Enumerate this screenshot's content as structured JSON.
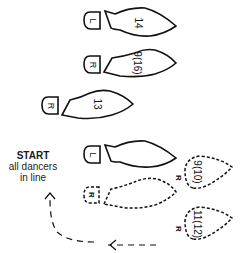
{
  "diagram": {
    "type": "dance-step-footprints",
    "start": {
      "title": "START",
      "line1": "all dancers",
      "line2": "in line"
    },
    "footprints": [
      {
        "id": "fp1",
        "foot": "L",
        "step": "14",
        "style": "solid",
        "size": "full"
      },
      {
        "id": "fp2",
        "foot": "R",
        "step": "9(16)",
        "style": "solid",
        "size": "full"
      },
      {
        "id": "fp3",
        "foot": "R",
        "step": "13",
        "style": "solid",
        "size": "full"
      },
      {
        "id": "fp4",
        "foot": "L",
        "step": "",
        "style": "solid",
        "size": "full"
      },
      {
        "id": "fp5",
        "foot": "R",
        "step": "",
        "style": "dashed",
        "size": "full"
      },
      {
        "id": "fp6",
        "foot": "R",
        "step": "9(10)",
        "style": "dashed",
        "size": "ball-only"
      },
      {
        "id": "fp7",
        "foot": "R",
        "step": "11(12)",
        "style": "dashed",
        "size": "ball-only"
      }
    ],
    "arrow": {
      "style": "dashed",
      "direction": "to-start"
    },
    "colors": {
      "ink": "#111111",
      "background": "#ffffff"
    }
  }
}
